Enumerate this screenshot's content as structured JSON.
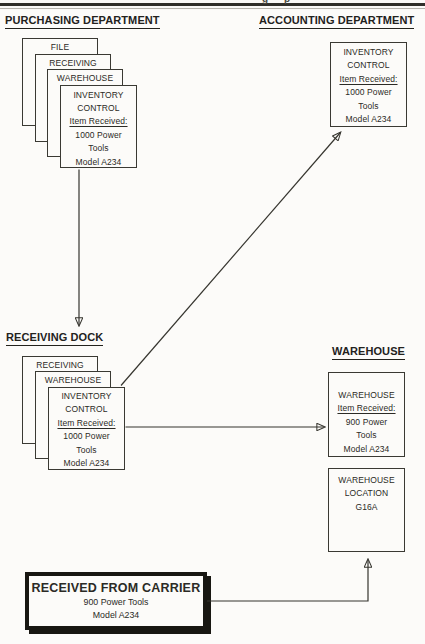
{
  "page": {
    "running_header_fragment": "g p",
    "paper_color": "#fcfbf9",
    "ink_color": "#2b2a25"
  },
  "purchasing": {
    "title": "PURCHASING DEPARTMENT",
    "stack": {
      "back_forms": [
        "FILE",
        "RECEIVING",
        "WAREHOUSE"
      ],
      "front_form": [
        "INVENTORY",
        "CONTROL",
        "Item Received:",
        "1000 Power",
        "Tools",
        "Model A234"
      ]
    }
  },
  "accounting": {
    "title": "ACCOUNTING DEPARTMENT",
    "document": [
      "INVENTORY",
      "CONTROL",
      "Item Received:",
      "1000 Power",
      "Tools",
      "Model A234"
    ]
  },
  "receiving_dock": {
    "title": "RECEIVING DOCK",
    "stack": {
      "back_forms": [
        "RECEIVING",
        "WAREHOUSE"
      ],
      "front_form": [
        "INVENTORY",
        "CONTROL",
        "Item Received:",
        "1000 Power",
        "Tools",
        "Model A234"
      ]
    }
  },
  "warehouse": {
    "title": "WAREHOUSE",
    "copy_document": [
      "WAREHOUSE",
      "Item Received:",
      "900 Power",
      "Tools",
      "Model A234"
    ],
    "location_document": [
      "WAREHOUSE",
      "LOCATION",
      "G16A"
    ]
  },
  "carrier": {
    "title": "RECEIVED FROM CARRIER",
    "lines": [
      "900 Power Tools",
      "Model A234"
    ]
  },
  "flows": [
    {
      "from": "purchasing-inventory-control",
      "to": "receiving-dock"
    },
    {
      "from": "receiving-dock-stack",
      "to": "accounting-inventory-control"
    },
    {
      "from": "receiving-dock-stack",
      "to": "warehouse-copy"
    },
    {
      "from": "received-from-carrier",
      "to": "warehouse-location"
    }
  ]
}
